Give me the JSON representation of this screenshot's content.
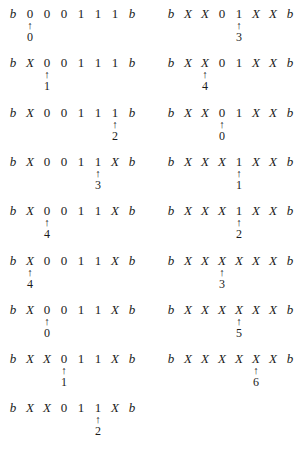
{
  "figure": {
    "left_column": [
      {
        "tape": [
          "b",
          "0",
          "0",
          "0",
          "1",
          "1",
          "1",
          "b"
        ],
        "head": 1,
        "state": "0"
      },
      {
        "tape": [
          "b",
          "X",
          "0",
          "0",
          "1",
          "1",
          "1",
          "b"
        ],
        "head": 2,
        "state": "1"
      },
      {
        "tape": [
          "b",
          "X",
          "0",
          "0",
          "1",
          "1",
          "1",
          "b"
        ],
        "head": 6,
        "state": "2"
      },
      {
        "tape": [
          "b",
          "X",
          "0",
          "0",
          "1",
          "1",
          "X",
          "b"
        ],
        "head": 5,
        "state": "3"
      },
      {
        "tape": [
          "b",
          "X",
          "0",
          "0",
          "1",
          "1",
          "X",
          "b"
        ],
        "head": 2,
        "state": "4"
      },
      {
        "tape": [
          "b",
          "X",
          "0",
          "0",
          "1",
          "1",
          "X",
          "b"
        ],
        "head": 1,
        "state": "4"
      },
      {
        "tape": [
          "b",
          "X",
          "0",
          "0",
          "1",
          "1",
          "X",
          "b"
        ],
        "head": 2,
        "state": "0"
      },
      {
        "tape": [
          "b",
          "X",
          "X",
          "0",
          "1",
          "1",
          "X",
          "b"
        ],
        "head": 3,
        "state": "1"
      },
      {
        "tape": [
          "b",
          "X",
          "X",
          "0",
          "1",
          "1",
          "X",
          "b"
        ],
        "head": 5,
        "state": "2"
      }
    ],
    "right_column": [
      {
        "tape": [
          "b",
          "X",
          "X",
          "0",
          "1",
          "X",
          "X",
          "b"
        ],
        "head": 4,
        "state": "3"
      },
      {
        "tape": [
          "b",
          "X",
          "X",
          "0",
          "1",
          "X",
          "X",
          "b"
        ],
        "head": 2,
        "state": "4"
      },
      {
        "tape": [
          "b",
          "X",
          "X",
          "0",
          "1",
          "X",
          "X",
          "b"
        ],
        "head": 3,
        "state": "0"
      },
      {
        "tape": [
          "b",
          "X",
          "X",
          "X",
          "1",
          "X",
          "X",
          "b"
        ],
        "head": 4,
        "state": "1"
      },
      {
        "tape": [
          "b",
          "X",
          "X",
          "X",
          "1",
          "X",
          "X",
          "b"
        ],
        "head": 4,
        "state": "2"
      },
      {
        "tape": [
          "b",
          "X",
          "X",
          "X",
          "X",
          "X",
          "X",
          "b"
        ],
        "head": 3,
        "state": "3"
      },
      {
        "tape": [
          "b",
          "X",
          "X",
          "X",
          "X",
          "X",
          "X",
          "b"
        ],
        "head": 4,
        "state": "5"
      },
      {
        "tape": [
          "b",
          "X",
          "X",
          "X",
          "X",
          "X",
          "X",
          "b"
        ],
        "head": 5,
        "state": "6"
      }
    ],
    "arrow_glyph": "↑"
  }
}
